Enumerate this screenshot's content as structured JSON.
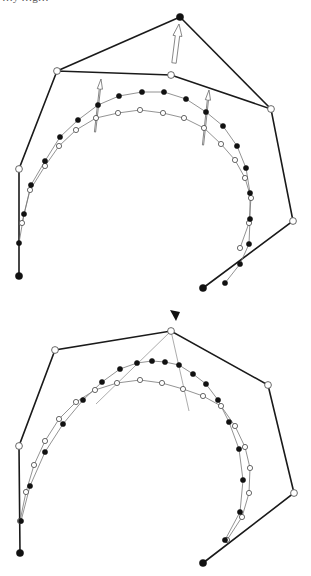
{
  "header_fragment": "…y  …g…",
  "colors": {
    "background": "#ffffff",
    "polygon": "#1a1a1a",
    "curve": "#777777",
    "filled_point": "#111111",
    "open_point": "#ffffff"
  },
  "diagrams": [
    {
      "id": "top",
      "description": "Control polygon with one control point moved outward; old and new B-spline curves with displacement arrows",
      "control_polygon_old": [
        [
          19,
          276
        ],
        [
          19,
          169
        ],
        [
          57,
          71
        ],
        [
          171,
          75
        ],
        [
          271,
          109
        ],
        [
          293,
          221
        ],
        [
          203,
          288
        ]
      ],
      "endpoint_filled": [
        [
          19,
          276
        ],
        [
          203,
          288
        ]
      ],
      "moved_control_point": [
        180,
        17
      ],
      "moved_edges": [
        [
          [
            57,
            71
          ],
          [
            180,
            17
          ]
        ],
        [
          [
            180,
            17
          ],
          [
            271,
            109
          ]
        ]
      ],
      "main_arrow": {
        "from": [
          174,
          63
        ],
        "to": [
          179,
          24
        ]
      },
      "curve_new_filled": [
        [
          19,
          243
        ],
        [
          24,
          214
        ],
        [
          31,
          185
        ],
        [
          45,
          161
        ],
        [
          60,
          137
        ],
        [
          78,
          120
        ],
        [
          98,
          105
        ],
        [
          119,
          96
        ],
        [
          142,
          92
        ],
        [
          164,
          92
        ],
        [
          186,
          99
        ],
        [
          206,
          112
        ],
        [
          223,
          126
        ],
        [
          237,
          146
        ],
        [
          246,
          168
        ],
        [
          250,
          193
        ],
        [
          250,
          219
        ],
        [
          249,
          244
        ],
        [
          240,
          264
        ],
        [
          225,
          283
        ]
      ],
      "curve_old_open": [
        [
          22,
          223
        ],
        [
          30,
          190
        ],
        [
          45,
          166
        ],
        [
          59,
          146
        ],
        [
          76,
          130
        ],
        [
          96,
          118
        ],
        [
          118,
          113
        ],
        [
          140,
          110
        ],
        [
          163,
          113
        ],
        [
          184,
          118
        ],
        [
          204,
          128
        ],
        [
          221,
          144
        ],
        [
          235,
          160
        ],
        [
          245,
          178
        ],
        [
          251,
          198
        ],
        [
          249,
          223
        ],
        [
          240,
          248
        ]
      ],
      "small_arrows": [
        {
          "from": [
            95,
            132
          ],
          "to": [
            101,
            79
          ]
        },
        {
          "from": [
            203,
            145
          ],
          "to": [
            209,
            90
          ]
        }
      ]
    },
    {
      "id": "bottom",
      "description": "Control polygon with vertex marked by triangle; two curves with tangent/guide lines from the marked vertex",
      "control_polygon": [
        [
          20,
          553
        ],
        [
          19,
          446
        ],
        [
          55,
          350
        ],
        [
          171,
          331
        ],
        [
          268,
          385
        ],
        [
          294,
          493
        ],
        [
          203,
          563
        ]
      ],
      "endpoint_filled": [
        [
          20,
          553
        ],
        [
          203,
          563
        ]
      ],
      "marker_triangle": [
        175,
        315
      ],
      "guide_lines": [
        {
          "from": [
            171,
            331
          ],
          "to": [
            96,
            404
          ]
        },
        {
          "from": [
            171,
            331
          ],
          "to": [
            189,
            411
          ]
        }
      ],
      "curve_new_filled": [
        [
          21,
          521
        ],
        [
          30,
          486
        ],
        [
          45,
          452
        ],
        [
          63,
          424
        ],
        [
          83,
          400
        ],
        [
          102,
          382
        ],
        [
          120,
          369
        ],
        [
          137,
          363
        ],
        [
          152,
          361
        ],
        [
          165,
          362
        ],
        [
          179,
          365
        ],
        [
          193,
          374
        ],
        [
          206,
          384
        ],
        [
          218,
          400
        ],
        [
          229,
          422
        ],
        [
          239,
          449
        ],
        [
          243,
          480
        ],
        [
          240,
          512
        ],
        [
          225,
          540
        ]
      ],
      "curve_old_open": [
        [
          20,
          521
        ],
        [
          26,
          492
        ],
        [
          34,
          465
        ],
        [
          45,
          441
        ],
        [
          59,
          419
        ],
        [
          76,
          402
        ],
        [
          95,
          390
        ],
        [
          117,
          383
        ],
        [
          140,
          380
        ],
        [
          162,
          383
        ],
        [
          183,
          389
        ],
        [
          203,
          396
        ],
        [
          221,
          406
        ],
        [
          235,
          426
        ],
        [
          245,
          447
        ],
        [
          250,
          468
        ],
        [
          249,
          493
        ],
        [
          242,
          517
        ],
        [
          227,
          540
        ]
      ]
    }
  ]
}
